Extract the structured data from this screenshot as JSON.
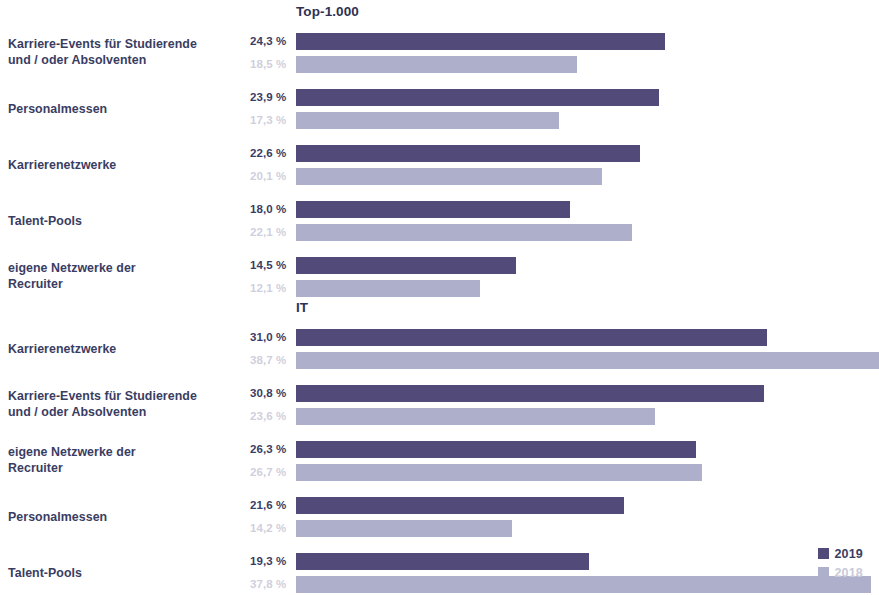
{
  "legend": {
    "items": [
      {
        "label": "2019",
        "color": "#524b79"
      },
      {
        "label": "2018",
        "color": "#aeafcb"
      }
    ]
  },
  "panels": [
    {
      "title": "Top-1.000",
      "rows": [
        {
          "label_line1": "Karriere-Events für Studierende",
          "label_line2": "und / oder Absolventen",
          "v2019": "24,3 %",
          "v2018": "18,5 %"
        },
        {
          "label_line1": "Personalmessen",
          "label_line2": "",
          "v2019": "23,9 %",
          "v2018": "17,3 %"
        },
        {
          "label_line1": "Karrierenetzwerke",
          "label_line2": "",
          "v2019": "22,6 %",
          "v2018": "20,1 %"
        },
        {
          "label_line1": "Talent-Pools",
          "label_line2": "",
          "v2019": "18,0 %",
          "v2018": "22,1 %"
        },
        {
          "label_line1": "eigene Netzwerke der",
          "label_line2": "Recruiter",
          "v2019": "14,5 %",
          "v2018": "12,1 %"
        }
      ]
    },
    {
      "title": "IT",
      "rows": [
        {
          "label_line1": "Karrierenetzwerke",
          "label_line2": "",
          "v2019": "31,0 %",
          "v2018": "38,7 %"
        },
        {
          "label_line1": "Karriere-Events für Studierende",
          "label_line2": "und / oder Absolventen",
          "v2019": "30,8 %",
          "v2018": "23,6 %"
        },
        {
          "label_line1": "eigene Netzwerke der",
          "label_line2": "Recruiter",
          "v2019": "26,3 %",
          "v2018": "26,7 %"
        },
        {
          "label_line1": "Personalmessen",
          "label_line2": "",
          "v2019": "21,6 %",
          "v2018": "14,2 %"
        },
        {
          "label_line1": "Talent-Pools",
          "label_line2": "",
          "v2019": "19,3 %",
          "v2018": "37,8 %"
        }
      ]
    }
  ],
  "chart_data": {
    "type": "bar",
    "title": "",
    "orientation": "horizontal",
    "xlabel": "",
    "ylabel": "",
    "xlim": [
      0,
      40
    ],
    "grid": false,
    "legend_position": "bottom-right",
    "series_names": [
      "2019",
      "2018"
    ],
    "series_colors": {
      "2019": "#524b79",
      "2018": "#aeafcb"
    },
    "panels": [
      {
        "name": "Top-1.000",
        "categories": [
          "Karriere-Events für Studierende und / oder Absolventen",
          "Personalmessen",
          "Karrierenetzwerke",
          "Talent-Pools",
          "eigene Netzwerke der Recruiter"
        ],
        "series": [
          {
            "name": "2019",
            "values": [
              24.3,
              23.9,
              22.6,
              18.0,
              14.5
            ]
          },
          {
            "name": "2018",
            "values": [
              18.5,
              17.3,
              20.1,
              22.1,
              12.1
            ]
          }
        ]
      },
      {
        "name": "IT",
        "categories": [
          "Karrierenetzwerke",
          "Karriere-Events für Studierende und / oder Absolventen",
          "eigene Netzwerke der Recruiter",
          "Personalmessen",
          "Talent-Pools"
        ],
        "series": [
          {
            "name": "2019",
            "values": [
              31.0,
              30.8,
              26.3,
              21.6,
              19.3
            ]
          },
          {
            "name": "2018",
            "values": [
              38.7,
              23.6,
              26.7,
              14.2,
              37.8
            ]
          }
        ]
      }
    ]
  },
  "scale": {
    "px_per_percent": 15.2,
    "bar_origin_x": 296
  }
}
